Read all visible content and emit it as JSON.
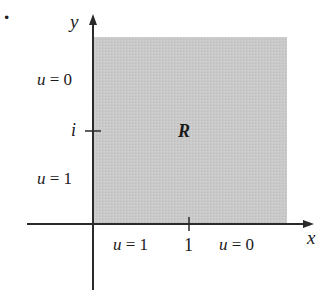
{
  "figure": {
    "bullet": "·",
    "region_label": "R",
    "axes": {
      "x_label": "x",
      "y_label": "y",
      "x_tick": "1",
      "y_tick": "i"
    },
    "boundary_labels": {
      "left_upper": {
        "var": "u",
        "eq": "= 0"
      },
      "left_lower": {
        "var": "u",
        "eq": "= 1"
      },
      "bottom_left": {
        "var": "u",
        "eq": "= 1"
      },
      "bottom_right": {
        "var": "u",
        "eq": "= 0"
      }
    },
    "colors": {
      "region_fill": "#c9c9c9",
      "axis": "#2a2a2a",
      "background": "#ffffff"
    }
  }
}
